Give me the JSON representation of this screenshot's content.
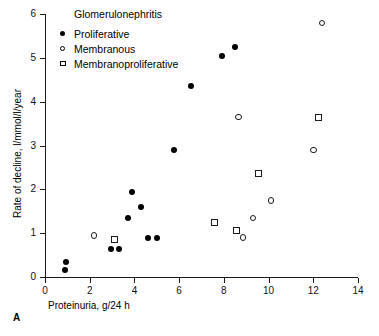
{
  "chart_data": {
    "type": "scatter",
    "title": "Glomerulonephritis",
    "xlabel": "Proteinuria, g/24 h",
    "ylabel": "Rate of decline, l/mmol/l/year",
    "xlim": [
      0,
      14
    ],
    "ylim": [
      0,
      6
    ],
    "xticks": [
      0,
      2,
      4,
      6,
      8,
      10,
      12,
      14
    ],
    "yticks": [
      0,
      1,
      2,
      3,
      4,
      5,
      6
    ],
    "grid": false,
    "legend_position": "top-left",
    "panel_label": "A",
    "series": [
      {
        "name": "Proliferative",
        "marker": "filled-circle",
        "color": "#000000",
        "points": [
          [
            0.9,
            0.17
          ],
          [
            0.95,
            0.35
          ],
          [
            2.95,
            0.65
          ],
          [
            3.3,
            0.65
          ],
          [
            3.7,
            1.35
          ],
          [
            3.9,
            1.95
          ],
          [
            4.3,
            1.6
          ],
          [
            4.6,
            0.9
          ],
          [
            5.0,
            0.88
          ],
          [
            5.75,
            2.9
          ],
          [
            6.55,
            4.35
          ],
          [
            7.9,
            5.05
          ],
          [
            8.5,
            5.25
          ]
        ]
      },
      {
        "name": "Membranous",
        "marker": "open-circle",
        "color": "#1a1a1a",
        "points": [
          [
            2.2,
            0.95
          ],
          [
            8.85,
            0.9
          ],
          [
            9.3,
            1.35
          ],
          [
            10.1,
            1.75
          ],
          [
            8.65,
            3.65
          ],
          [
            12.0,
            2.9
          ],
          [
            12.4,
            5.8
          ]
        ]
      },
      {
        "name": "Membranoproliferative",
        "marker": "open-square",
        "color": "#1a1a1a",
        "points": [
          [
            3.1,
            0.85
          ],
          [
            7.6,
            1.25
          ],
          [
            8.55,
            1.05
          ],
          [
            9.55,
            2.35
          ],
          [
            12.25,
            3.65
          ]
        ]
      }
    ]
  },
  "legend": {
    "title": "Glomerulonephritis",
    "entries": [
      {
        "label": "Proliferative",
        "marker": "filled-circle"
      },
      {
        "label": "Membranous",
        "marker": "open-circle"
      },
      {
        "label": "Membranoproliferative",
        "marker": "open-square"
      }
    ]
  },
  "panel": {
    "label": "A"
  }
}
